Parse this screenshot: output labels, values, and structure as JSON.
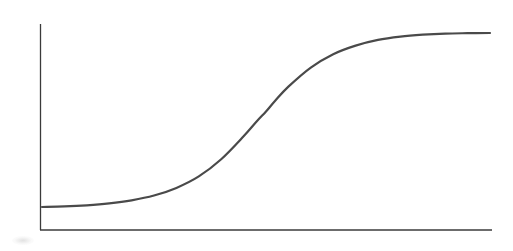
{
  "figure": {
    "kind": "line-chart",
    "caption": "",
    "background_color": "#ffffff",
    "curve_color": "#4a4a4a",
    "axis_color": "#3b3b3b",
    "curve_stroke_width": 2.2,
    "axis_stroke_width": 1.3
  },
  "axes": {
    "y_axis": {
      "label": "",
      "tick_labels": [],
      "x_px": 40,
      "top_px": 24,
      "bottom_px": 230
    },
    "x_axis": {
      "label": "",
      "tick_labels": [],
      "y_px": 230,
      "left_px": 40,
      "right_px": 492
    },
    "grid": "off",
    "legend": "none"
  },
  "chart_data": {
    "type": "line",
    "title": "",
    "subtitle": "",
    "xlabel": "",
    "ylabel": "",
    "xlim": [
      0,
      1
    ],
    "ylim": [
      0,
      1
    ],
    "x_tick_labels": [],
    "y_tick_labels": [],
    "grid": false,
    "legend_position": "none",
    "annotations": [],
    "series": [
      {
        "name": "sigmoid",
        "color": "#4a4a4a",
        "x": [
          0.0,
          0.05,
          0.1,
          0.15,
          0.2,
          0.25,
          0.3,
          0.35,
          0.4,
          0.45,
          0.48,
          0.5,
          0.52,
          0.55,
          0.6,
          0.65,
          0.7,
          0.75,
          0.8,
          0.85,
          0.9,
          0.95,
          1.0
        ],
        "y": [
          0.06,
          0.063,
          0.069,
          0.079,
          0.095,
          0.12,
          0.16,
          0.22,
          0.31,
          0.43,
          0.51,
          0.56,
          0.615,
          0.69,
          0.79,
          0.86,
          0.905,
          0.935,
          0.952,
          0.962,
          0.968,
          0.97,
          0.971
        ]
      }
    ],
    "pixel_path": {
      "start": [
        42,
        207
      ],
      "inflection": [
        258,
        120
      ],
      "end": [
        490,
        33
      ],
      "left_plateau_y": 207,
      "right_plateau_y": 33
    }
  }
}
